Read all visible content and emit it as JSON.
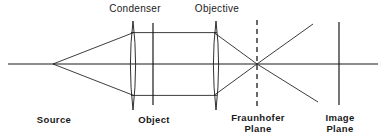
{
  "diagram": {
    "stroke_color": "#1a1a1a",
    "background_color": "#ffffff",
    "labels": {
      "condenser": "Condenser",
      "objective": "Objective",
      "source": "Source",
      "object": "Object",
      "fraunhofer_plane": "Fraunhofer\nPlane",
      "image_plane": "Image\nPlane"
    },
    "elements": {
      "optical_axis": {
        "x1": 8,
        "y1": 64,
        "x2": 378,
        "y2": 64
      },
      "source_point": {
        "x": 53,
        "y": 64
      },
      "condenser_lens": {
        "x": 133,
        "top": 21,
        "bottom": 110,
        "half_width": 4.5
      },
      "object_plane": {
        "x": 153,
        "top": 23,
        "bottom": 105
      },
      "objective_lens": {
        "x": 216,
        "top": 21,
        "bottom": 110,
        "half_width": 4.5
      },
      "fraunhofer_plane": {
        "x": 257,
        "top": 20,
        "bottom": 108,
        "dashed": true
      },
      "image_plane": {
        "x": 339,
        "top": 22,
        "bottom": 105
      },
      "focus_point": {
        "x": 257,
        "y": 64
      }
    },
    "rays": {
      "upper_cone": {
        "from_x": 53,
        "from_y": 64,
        "to_x": 133,
        "to_y": 33
      },
      "lower_cone": {
        "from_x": 53,
        "from_y": 64,
        "to_x": 133,
        "to_y": 95
      },
      "upper_collimated": {
        "from_x": 133,
        "from_y": 33,
        "to_x": 216,
        "to_y": 33
      },
      "lower_collimated": {
        "from_x": 133,
        "from_y": 95,
        "to_x": 216,
        "to_y": 95
      },
      "upper_converging": {
        "from_x": 216,
        "from_y": 33,
        "to_x": 257,
        "to_y": 64
      },
      "lower_converging": {
        "from_x": 216,
        "from_y": 95,
        "to_x": 257,
        "to_y": 64
      },
      "upper_diverging": {
        "from_x": 257,
        "from_y": 64,
        "to_x": 313,
        "to_y": 24
      },
      "lower_diverging": {
        "from_x": 257,
        "from_y": 64,
        "to_x": 318,
        "to_y": 102
      }
    }
  }
}
